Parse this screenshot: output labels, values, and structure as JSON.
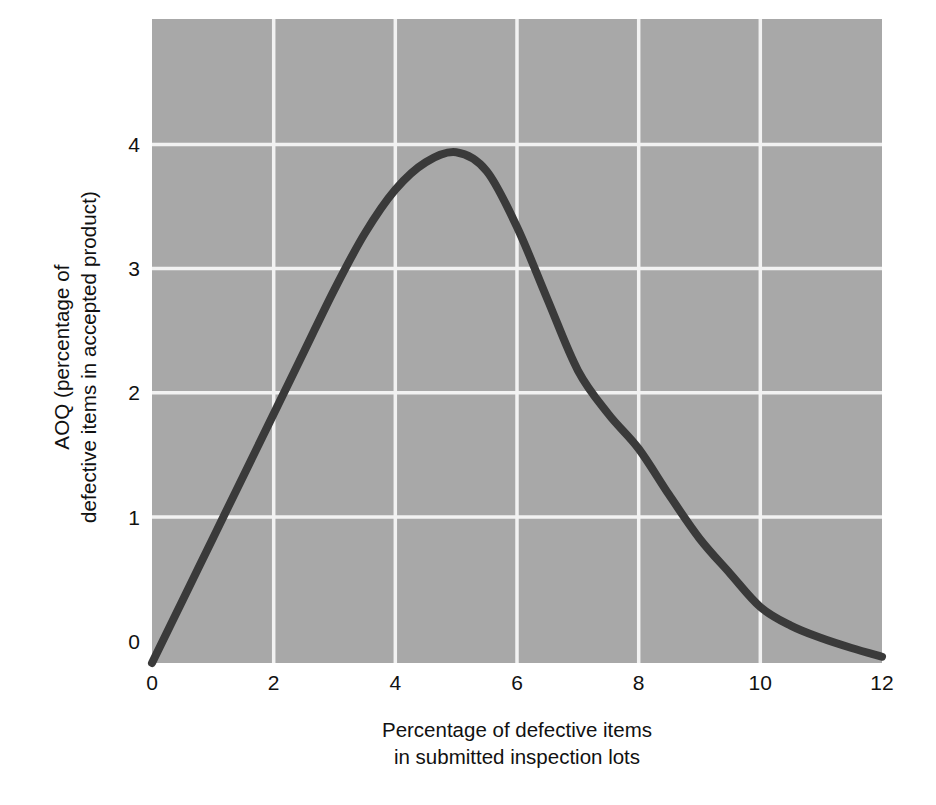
{
  "chart_data": {
    "type": "line",
    "title": "",
    "xlabel": "Percentage of defective items in submitted inspection lots",
    "xlabel_lines": [
      "Percentage of defective items",
      "in submitted inspection lots"
    ],
    "ylabel": "AOQ (percentage of defective items in accepted product)",
    "ylabel_lines": [
      "AOQ (percentage of",
      "defective items in accepted product)"
    ],
    "xlim": [
      0,
      12
    ],
    "ylim": [
      0,
      5.17
    ],
    "xticks": [
      0,
      2,
      4,
      6,
      8,
      10,
      12
    ],
    "xtick_labels": [
      "0",
      "2",
      "4",
      "6",
      "8",
      "10",
      "12"
    ],
    "yticks": [
      0,
      1,
      2,
      3,
      4
    ],
    "ytick_labels": [
      "0",
      "1",
      "2",
      "3",
      "4"
    ],
    "grid": true,
    "grid_color": "#f2f2f2",
    "plot_bg_color": "#a8a8a8",
    "page_bg_color": "#ffffff",
    "series": [
      {
        "name": "AOQ curve",
        "color": "#3a3a3a",
        "line_width": 8,
        "x": [
          0,
          0.5,
          1,
          1.5,
          2,
          2.5,
          3,
          3.5,
          4,
          4.5,
          5,
          5.5,
          6,
          6.5,
          7,
          7.5,
          8,
          8.5,
          9,
          9.5,
          10,
          10.5,
          11,
          11.5,
          12
        ],
        "y": [
          0,
          0.5,
          1.0,
          1.5,
          2.0,
          2.5,
          3.0,
          3.45,
          3.8,
          4.02,
          4.1,
          3.95,
          3.5,
          2.92,
          2.35,
          2.0,
          1.72,
          1.35,
          1.0,
          0.72,
          0.45,
          0.3,
          0.2,
          0.12,
          0.05
        ]
      }
    ],
    "peak": {
      "x": 5.0,
      "y": 4.1
    }
  },
  "axes": {
    "y_title_line1": "AOQ (percentage of",
    "y_title_line2": "defective items in accepted product)",
    "x_title_line1": "Percentage of defective items",
    "x_title_line2": "in submitted inspection lots"
  },
  "ticks": {
    "x": [
      "0",
      "2",
      "4",
      "6",
      "8",
      "10",
      "12"
    ],
    "y": [
      "4",
      "3",
      "2",
      "1",
      "0"
    ]
  }
}
